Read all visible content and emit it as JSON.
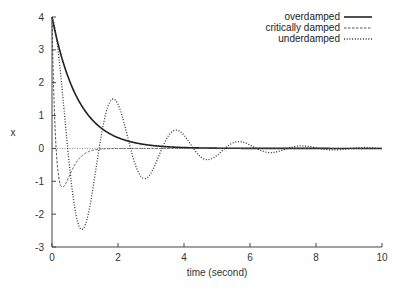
{
  "chart_data": {
    "type": "line",
    "title": "",
    "xlabel": "time (second)",
    "ylabel": "x",
    "xlim": [
      0,
      10
    ],
    "ylim": [
      -3,
      4
    ],
    "xticks": [
      0,
      2,
      4,
      6,
      8,
      10
    ],
    "yticks": [
      -3,
      -2,
      -1,
      0,
      1,
      2,
      3,
      4
    ],
    "grid": false,
    "legend_position": "top-right",
    "zero_line": {
      "y": 0,
      "style": "dotted"
    },
    "series": [
      {
        "name": "overdamped",
        "style": "solid",
        "x": [
          0,
          0.25,
          0.5,
          0.75,
          1,
          1.5,
          2,
          2.5,
          3,
          4,
          5,
          6,
          8,
          10
        ],
        "y": [
          4.0,
          2.95,
          2.18,
          1.61,
          1.19,
          0.65,
          0.36,
          0.2,
          0.11,
          0.03,
          0.01,
          0.0,
          0.0,
          0.0
        ]
      },
      {
        "name": "critically damped",
        "style": "dashed",
        "x": [
          0,
          0.1,
          0.2,
          0.3,
          0.4,
          0.5,
          0.75,
          1,
          1.5,
          2,
          2.5,
          3,
          4,
          6,
          10
        ],
        "y": [
          4.0,
          2.0,
          0.7,
          -0.05,
          -0.4,
          -0.55,
          -0.52,
          -0.42,
          -0.26,
          -0.15,
          -0.08,
          -0.04,
          -0.01,
          0.0,
          0.0
        ]
      },
      {
        "name": "underdamped",
        "style": "dotted",
        "x": [
          0,
          0.2,
          0.4,
          0.6,
          0.8,
          1.0,
          1.2,
          1.4,
          1.6,
          1.9,
          2.2,
          2.5,
          2.9,
          3.3,
          3.6,
          4.0,
          4.4,
          4.8,
          5.2,
          5.6,
          6.0,
          6.4,
          6.8,
          7.2,
          7.6,
          8.0,
          8.4,
          8.8,
          9.2,
          9.6,
          10.0
        ],
        "y": [
          4.0,
          2.2,
          -0.2,
          -1.9,
          -2.6,
          -2.3,
          -1.3,
          -0.1,
          0.9,
          1.5,
          1.0,
          0.0,
          -0.9,
          -0.5,
          0.1,
          0.5,
          0.3,
          -0.1,
          -0.3,
          -0.15,
          0.1,
          0.15,
          0.05,
          -0.08,
          -0.08,
          0.0,
          0.05,
          0.03,
          -0.02,
          -0.03,
          0.0
        ]
      }
    ]
  },
  "legend": {
    "items": [
      {
        "label": "overdamped",
        "style": "solid"
      },
      {
        "label": "critically damped",
        "style": "dashed"
      },
      {
        "label": "underdamped",
        "style": "dotted"
      }
    ]
  },
  "axes": {
    "xlabel": "time (second)",
    "ylabel": "x",
    "xtick_labels": [
      "0",
      "2",
      "4",
      "6",
      "8",
      "10"
    ],
    "ytick_labels": [
      "4",
      "3",
      "2",
      "1",
      "0",
      "-1",
      "-2",
      "-3"
    ]
  },
  "colors": {
    "line": "#222222",
    "axis": "#444444",
    "background": "#ffffff"
  }
}
